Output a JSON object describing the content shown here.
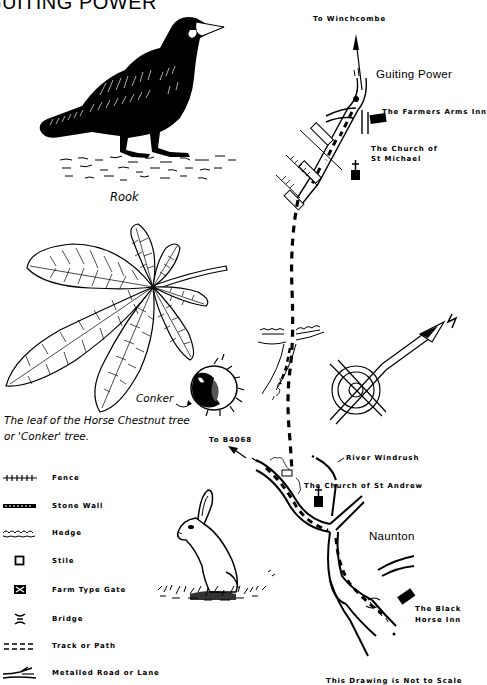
{
  "title": "GUITING POWER",
  "illustrations": {
    "rook": {
      "caption": "Rook"
    },
    "leaf": {
      "caption_line1": "The leaf of the Horse Chestnut tree",
      "caption_line2": "or 'Conker' tree."
    },
    "conker": {
      "caption": "Conker"
    },
    "rabbit": {}
  },
  "map": {
    "labels": {
      "to_winchcombe": "To Winchcombe",
      "guiting_power": "Guiting Power",
      "farmers_arms": "The Farmers Arms Inn",
      "church_st_michael_1": "The Church of",
      "church_st_michael_2": "St Michael",
      "to_b4068": "To B4068",
      "river_windrush": "River Windrush",
      "church_st_andrew": "The Church of St Andrew",
      "naunton": "Naunton",
      "black_horse_1": "The Black",
      "black_horse_2": "Horse Inn",
      "north": "N",
      "scale_note": "This Drawing is Not to Scale"
    }
  },
  "legend": {
    "items": [
      {
        "symbol": "fence",
        "label": "Fence"
      },
      {
        "symbol": "stone-wall",
        "label": "Stone Wall"
      },
      {
        "symbol": "hedge",
        "label": "Hedge"
      },
      {
        "symbol": "stile",
        "label": "Stile"
      },
      {
        "symbol": "farm-gate",
        "label": "Farm Type Gate"
      },
      {
        "symbol": "bridge",
        "label": "Bridge"
      },
      {
        "symbol": "track",
        "label": "Track or Path"
      },
      {
        "symbol": "road",
        "label": "Metalled Road or Lane"
      }
    ]
  }
}
